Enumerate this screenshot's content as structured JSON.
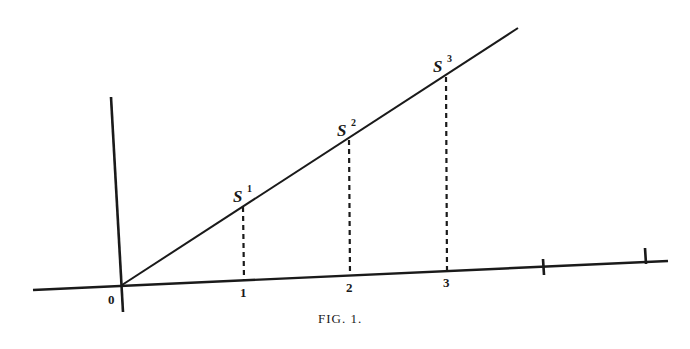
{
  "figure": {
    "caption": "Fig. 1.",
    "caption_display": "FIG. 1.",
    "origin_label": "0",
    "axis_ticks": [
      {
        "label": "1"
      },
      {
        "label": "2"
      },
      {
        "label": "3"
      }
    ],
    "points": [
      {
        "base": "S",
        "sup": "1"
      },
      {
        "base": "S",
        "sup": "2"
      },
      {
        "base": "S",
        "sup": "3"
      }
    ],
    "colors": {
      "ink": "#1a1a1a",
      "background": "#ffffff"
    }
  }
}
